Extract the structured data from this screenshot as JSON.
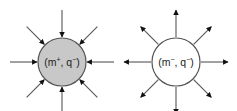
{
  "diagram": {
    "nodes": [
      {
        "id": "sink",
        "label_open": "(m",
        "label_sup1": "+",
        "label_mid": ", q",
        "label_sup2": "−",
        "label_close": ")",
        "fill": "#c8c8c8",
        "arrow_direction": "inward"
      },
      {
        "id": "source",
        "label_open": "(m",
        "label_sup1": "−",
        "label_mid": ", q",
        "label_sup2": "−",
        "label_close": ")",
        "fill": "#ffffff",
        "arrow_direction": "outward"
      }
    ],
    "stroke_color": "#555555",
    "arrowhead_color": "#111111",
    "arrow_count": 8
  }
}
